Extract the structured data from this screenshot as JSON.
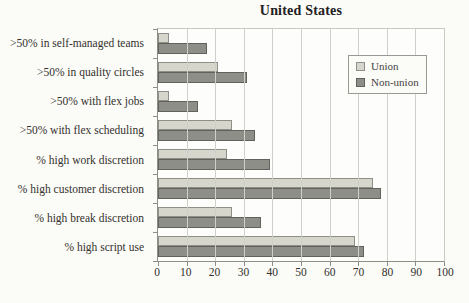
{
  "title": "United States",
  "chart_data": {
    "type": "bar",
    "orientation": "horizontal",
    "title": "United States",
    "categories": [
      ">50% in self-managed teams",
      ">50% in quality circles",
      ">50% with flex jobs",
      ">50% with flex scheduling",
      "% high work discretion",
      "% high customer discretion",
      "% high break discretion",
      "% high script use"
    ],
    "series": [
      {
        "name": "Union",
        "color": "#d6d6cd",
        "border": "#8f8f88",
        "values": [
          4,
          21,
          4,
          26,
          24,
          75,
          26,
          69
        ]
      },
      {
        "name": "Non-union",
        "color": "#8e8e89",
        "border": "#62625d",
        "values": [
          17,
          31,
          14,
          34,
          39,
          78,
          36,
          72
        ]
      }
    ],
    "xlim": [
      0,
      100
    ],
    "xticks": [
      0,
      10,
      20,
      30,
      40,
      50,
      60,
      70,
      80,
      90,
      100
    ],
    "grid": "vertical",
    "legend_position": "upper-right",
    "xlabel": "",
    "ylabel": ""
  },
  "colors": {
    "paper": "#fbfbf8",
    "title_text": "#22201d",
    "label_text": "#33312c",
    "gridline": "#d0d0cb",
    "axis": "#8e8e88",
    "plot_border": "#c9c9c4",
    "legend_border": "#9a9a94",
    "union_fill": "#d6d6cd",
    "non_union_fill": "#8e8e89"
  }
}
